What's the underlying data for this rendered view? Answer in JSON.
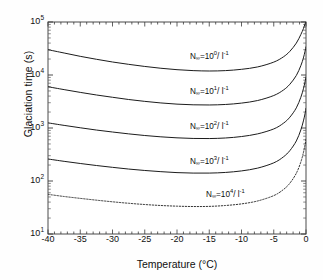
{
  "chart_data": {
    "type": "line",
    "title": "",
    "xlabel": "Temperature  (°C)",
    "ylabel": "Glaciation time (s)",
    "xlim": [
      -40,
      0
    ],
    "ylim": [
      10,
      100000
    ],
    "yscale": "log",
    "xscale": "linear",
    "grid": false,
    "legend_position": "inline-annotations",
    "xticks": [
      -40,
      -35,
      -30,
      -25,
      -20,
      -15,
      -10,
      -5,
      0
    ],
    "xticklabels": [
      "-40",
      "-35",
      "-30",
      "-25",
      "-20",
      "-15",
      "-10",
      "-5",
      "0"
    ],
    "yticks": [
      10,
      100,
      1000,
      10000,
      100000
    ],
    "yticklabels": [
      "10¹",
      "10²",
      "10³",
      "10⁴",
      "10⁵"
    ],
    "yticklabels_parts": [
      {
        "base": "10",
        "exp": "1"
      },
      {
        "base": "10",
        "exp": "2"
      },
      {
        "base": "10",
        "exp": "3"
      },
      {
        "base": "10",
        "exp": "4"
      },
      {
        "base": "10",
        "exp": "5"
      }
    ],
    "series": [
      {
        "name": "N∞=10⁰/l⁻¹",
        "label_prefix": "N",
        "label_sub": "∞",
        "label_mid": "=10",
        "label_exp": "0",
        "label_suffix": "/ l",
        "label_suffix_exp": "-1",
        "style": "solid",
        "x": [
          -40,
          -37.5,
          -35,
          -32.5,
          -30,
          -27.5,
          -25,
          -22.5,
          -20,
          -17.5,
          -15,
          -12.5,
          -10,
          -7.5,
          -5,
          -3.5,
          -2.5,
          -1.5,
          -0.8,
          -0.4,
          -0.15,
          0
        ],
        "y": [
          30000,
          26000,
          22500,
          19800,
          17600,
          15900,
          14500,
          13400,
          12600,
          12100,
          11900,
          12100,
          12800,
          14200,
          17500,
          22000,
          28000,
          40000,
          58000,
          75000,
          92000,
          100000
        ]
      },
      {
        "name": "N∞=10¹/l⁻¹",
        "label_prefix": "N",
        "label_sub": "∞",
        "label_mid": "=10",
        "label_exp": "1",
        "label_suffix": "/ l",
        "label_suffix_exp": "-1",
        "style": "solid",
        "x": [
          -40,
          -37.5,
          -35,
          -32.5,
          -30,
          -27.5,
          -25,
          -22.5,
          -20,
          -17.5,
          -15,
          -12.5,
          -10,
          -7.5,
          -5,
          -3.5,
          -2.5,
          -1.5,
          -0.8,
          -0.4,
          -0.15,
          0
        ],
        "y": [
          6000,
          5300,
          4700,
          4200,
          3800,
          3450,
          3180,
          2970,
          2820,
          2740,
          2720,
          2780,
          2950,
          3300,
          4100,
          5200,
          6700,
          9800,
          15000,
          21000,
          28000,
          34000
        ]
      },
      {
        "name": "N∞=10²/l⁻¹",
        "label_prefix": "N",
        "label_sub": "∞",
        "label_mid": "=10",
        "label_exp": "2",
        "label_suffix": "/ l",
        "label_suffix_exp": "-1",
        "style": "solid",
        "x": [
          -40,
          -37.5,
          -35,
          -32.5,
          -30,
          -27.5,
          -25,
          -22.5,
          -20,
          -17.5,
          -15,
          -12.5,
          -10,
          -7.5,
          -5,
          -3.5,
          -2.5,
          -1.5,
          -0.8,
          -0.4,
          -0.15,
          0
        ],
        "y": [
          1250,
          1120,
          1010,
          915,
          840,
          775,
          722,
          681,
          652,
          635,
          632,
          648,
          690,
          775,
          960,
          1230,
          1600,
          2400,
          3800,
          5500,
          7400,
          9200
        ]
      },
      {
        "name": "N∞=10³/l⁻¹",
        "label_prefix": "N",
        "label_sub": "∞",
        "label_mid": "=10",
        "label_exp": "3",
        "label_suffix": "/ l",
        "label_suffix_exp": "-1",
        "style": "solid",
        "x": [
          -40,
          -37.5,
          -35,
          -32.5,
          -30,
          -27.5,
          -25,
          -22.5,
          -20,
          -17.5,
          -15,
          -12.5,
          -10,
          -7.5,
          -5,
          -3.5,
          -2.5,
          -1.5,
          -0.8,
          -0.4,
          -0.15,
          0
        ],
        "y": [
          260,
          235,
          214,
          196,
          181,
          168,
          158,
          150,
          144,
          141,
          141,
          145,
          155,
          175,
          220,
          285,
          375,
          570,
          920,
          1360,
          1850,
          2350
        ]
      },
      {
        "name": "N∞=10⁴/l⁻¹",
        "label_prefix": "N",
        "label_sub": "∞",
        "label_mid": "=10",
        "label_exp": "4",
        "label_suffix": "/ l",
        "label_suffix_exp": "-1",
        "style": "dotted",
        "x": [
          -40,
          -37.5,
          -35,
          -32.5,
          -30,
          -27.5,
          -25,
          -22.5,
          -20,
          -17.5,
          -15,
          -12.5,
          -10,
          -7.5,
          -5,
          -3.5,
          -2.5,
          -1.5,
          -0.8,
          -0.4,
          -0.15,
          0
        ],
        "y": [
          56,
          51,
          47,
          43.5,
          40.5,
          38,
          36,
          34.5,
          33.5,
          33,
          33.2,
          34.5,
          37,
          42,
          53,
          69,
          91,
          140,
          228,
          345,
          480,
          620
        ]
      }
    ],
    "annotations": [
      {
        "text": "N∞=10⁰/l⁻¹",
        "x": -18.0,
        "y": 21000
      },
      {
        "text": "N∞=10¹/l⁻¹",
        "x": -18.0,
        "y": 4600
      },
      {
        "text": "N∞=10²/l⁻¹",
        "x": -18.0,
        "y": 1020
      },
      {
        "text": "N∞=10³/l⁻¹",
        "x": -18.0,
        "y": 222
      },
      {
        "text": "N∞=10⁴/l⁻¹",
        "x": -15.5,
        "y": 52
      }
    ]
  }
}
